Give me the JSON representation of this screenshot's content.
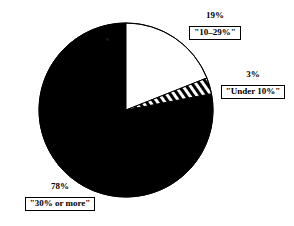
{
  "chart_data": {
    "type": "pie",
    "title": "",
    "subtitle": "",
    "xlabel": "",
    "ylabel": "",
    "legend_position": "none",
    "grid": false,
    "categories": [
      "\"10–29%\"",
      "\"Under 10%\"",
      "\"30% or more\""
    ],
    "values": [
      19,
      3,
      78
    ],
    "value_labels": [
      "19%",
      "3%",
      "78%"
    ],
    "slices": [
      {
        "label": "\"10–29%\"",
        "value_label": "19%",
        "value": 19,
        "fill": "white",
        "fill_color": "#ffffff",
        "stroke_color": "#000000",
        "start_angle_deg": 0,
        "end_angle_deg": 68.4
      },
      {
        "label": "\"Under 10%\"",
        "value_label": "3%",
        "value": 3,
        "fill": "hatched",
        "fill_color": "#ffffff",
        "stroke_color": "#000000",
        "start_angle_deg": 68.4,
        "end_angle_deg": 79.2
      },
      {
        "label": "\"30% or more\"",
        "value_label": "78%",
        "value": 78,
        "fill": "solid",
        "fill_color": "#000000",
        "stroke_color": "#000000",
        "start_angle_deg": 79.2,
        "end_angle_deg": 360
      }
    ]
  },
  "callouts": {
    "top": {
      "value": "19%",
      "label": "\"10–29%\""
    },
    "right": {
      "value": "3%",
      "label": "\"Under 10%\""
    },
    "bottom_left": {
      "value": "78%",
      "label": "\"30% or more\""
    }
  },
  "colors": {
    "ink": "#000000",
    "paper": "#ffffff"
  }
}
